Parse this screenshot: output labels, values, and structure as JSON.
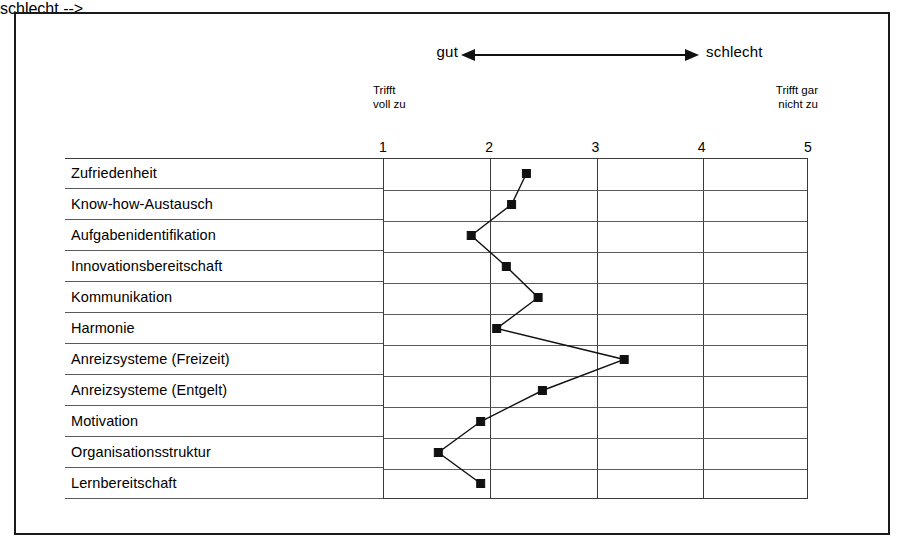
{
  "figure": {
    "direction_left_label": "gut",
    "direction_right_label": "schlecht",
    "anchor_left": "Trifft\nvoll zu",
    "anchor_right": "Trifft gar\nnicht zu",
    "arrow_icon": "double-headed-horizontal-arrow"
  },
  "chart_data": {
    "type": "line",
    "orientation": "horizontal",
    "title": "",
    "subtitle": "",
    "xlabel": "",
    "ylabel": "",
    "xlim": [
      1,
      5
    ],
    "grid": true,
    "legend": false,
    "xticks": [
      "1",
      "2",
      "3",
      "4",
      "5"
    ],
    "xtick_values": [
      1,
      2,
      3,
      4,
      5
    ],
    "axis_anchor_low": "Trifft voll zu",
    "axis_anchor_high": "Trifft gar nicht zu",
    "direction_low": "gut",
    "direction_high": "schlecht",
    "categories": [
      "Zufriedenheit",
      "Know-how-Austausch",
      "Aufgabenidentifikation",
      "Innovationsbereitschaft",
      "Kommunikation",
      "Harmonie",
      "Anreizsysteme (Freizeit)",
      "Anreizsysteme (Entgelt)",
      "Motivation",
      "Organisationsstruktur",
      "Lernbereitschaft"
    ],
    "values": [
      2.35,
      2.21,
      1.83,
      2.16,
      2.46,
      2.07,
      3.27,
      2.5,
      1.92,
      1.52,
      1.92
    ],
    "marker": "square",
    "marker_color": "#111111",
    "line_color": "#111111"
  }
}
